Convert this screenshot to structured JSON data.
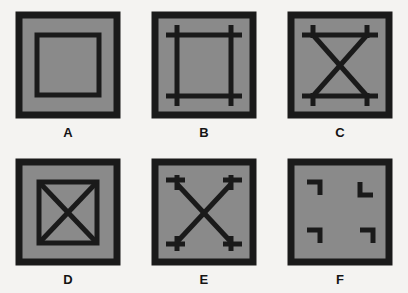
{
  "figure": {
    "title": "",
    "background_color": "#f4f3f1",
    "fill_color": "#8a8a8a",
    "stroke_color": "#1a1a1a",
    "rows": 2,
    "columns": 3
  },
  "panels": [
    {
      "id": "A",
      "label": "A",
      "description": "Outer square border with a smaller concentric square inside",
      "elements": [
        "outer-square",
        "inner-square"
      ]
    },
    {
      "id": "B",
      "label": "B",
      "description": "Outer square border with four overshooting straight lines forming an inner square with crossed corners",
      "elements": [
        "outer-square",
        "top-line",
        "bottom-line",
        "left-line",
        "right-line"
      ]
    },
    {
      "id": "C",
      "label": "C",
      "description": "Outer square border with top and bottom horizontal lines ending in short vertical stubs, and an X crossing between them",
      "elements": [
        "outer-square",
        "top-line",
        "bottom-line",
        "corner-stubs",
        "diagonal-x"
      ]
    },
    {
      "id": "D",
      "label": "D",
      "description": "Outer square border with a smaller inner square containing crossed diagonals forming an X",
      "elements": [
        "outer-square",
        "inner-square",
        "diagonal-x"
      ]
    },
    {
      "id": "E",
      "label": "E",
      "description": "Outer square border with a large X whose four ends terminate in small T-shaped brackets",
      "elements": [
        "outer-square",
        "diagonal-x",
        "corner-brackets"
      ]
    },
    {
      "id": "F",
      "label": "F",
      "description": "Outer square border with four small L-shaped corner brackets inside",
      "elements": [
        "outer-square",
        "corner-brackets"
      ]
    }
  ]
}
